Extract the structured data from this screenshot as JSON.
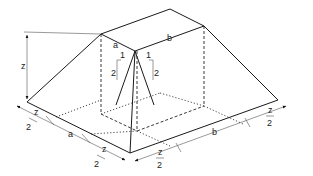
{
  "figure": {
    "type": "isometric-frustum-diagram",
    "labels": {
      "height": "z",
      "top_depth": "a",
      "top_width": "b",
      "slope_run": "1",
      "slope_rise": "2",
      "base_left_offset_num": "z",
      "base_left_offset_den": "2",
      "base_a": "a",
      "base_mid_offset_num": "z",
      "base_mid_offset_den": "2",
      "base_front_offset_num": "z",
      "base_front_offset_den": "2",
      "base_b": "b",
      "base_right_offset_num": "z",
      "base_right_offset_den": "2"
    },
    "colors": {
      "line": "#1a1a1a",
      "top_face_fill": "#e6e6e6"
    }
  }
}
